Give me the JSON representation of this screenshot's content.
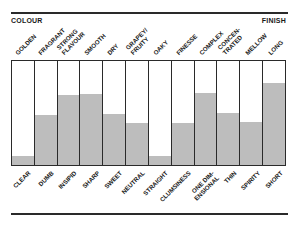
{
  "chart_data": {
    "type": "bar",
    "title": "",
    "header_left": "COLOUR",
    "header_right": "FINISH",
    "top_labels": [
      "GOLDEN",
      "FRAGRANT",
      "STRONG FLAVOUR",
      "SMOOTH",
      "DRY",
      "GRAPEY/ FRUITY",
      "OAKY",
      "FINESSE",
      "COMPLEX",
      "CONCEN- TRATED",
      "MELLOW",
      "LONG"
    ],
    "categories": [
      "CLEAR",
      "DUMB",
      "INSIPID",
      "SHARP",
      "SWEET",
      "NEUTRAL",
      "STRAIGHT",
      "CLUMSINESS",
      "ONE DIM- ENSIONAL",
      "THIN",
      "SPIRITY",
      "SHORT"
    ],
    "values": [
      9,
      48,
      67,
      68,
      49,
      40,
      9,
      40,
      69,
      50,
      41,
      79
    ],
    "value_scale": "percent of bar height filled (top label = 100, bottom label = 0)",
    "ylim": [
      0,
      100
    ],
    "grid": false,
    "legend": "none",
    "fill_color": "#bdbdbd",
    "line_color": "#2a2a2a"
  },
  "top_label_lines": [
    [
      "GOLDEN"
    ],
    [
      "FRAGRANT"
    ],
    [
      "STRONG",
      "FLAVOUR"
    ],
    [
      "SMOOTH"
    ],
    [
      "DRY"
    ],
    [
      "GRAPEY/",
      "FRUITY"
    ],
    [
      "OAKY"
    ],
    [
      "FINESSE"
    ],
    [
      "COMPLEX"
    ],
    [
      "CONCEN-",
      "TRATED"
    ],
    [
      "MELLOW"
    ],
    [
      "LONG"
    ]
  ],
  "bottom_label_lines": [
    [
      "CLEAR"
    ],
    [
      "DUMB"
    ],
    [
      "INSIPID"
    ],
    [
      "SHARP"
    ],
    [
      "SWEET"
    ],
    [
      "NEUTRAL"
    ],
    [
      "STRAIGHT"
    ],
    [
      "CLUMSINESS"
    ],
    [
      "ONE DIM-",
      "ENSIONAL"
    ],
    [
      "THIN"
    ],
    [
      "SPIRITY"
    ],
    [
      "SHORT"
    ]
  ]
}
